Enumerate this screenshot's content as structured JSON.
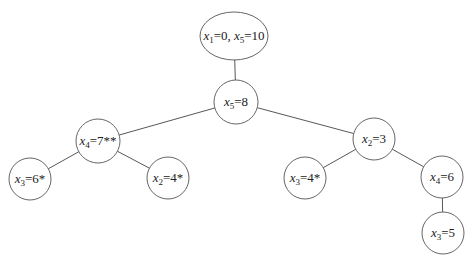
{
  "diagram": {
    "type": "branch-and-bound-tree",
    "width": 475,
    "height": 264,
    "colors": {
      "stroke": "#555555",
      "edge": "#444444",
      "text": "#222222",
      "background": "#ffffff"
    },
    "nodes": [
      {
        "id": "root",
        "shape": "ellipse",
        "cx": 234,
        "cy": 36,
        "rx": 34,
        "ry": 24,
        "terms": [
          {
            "var": "x",
            "sub": "1",
            "val": "=0, "
          },
          {
            "var": "x",
            "sub": "5",
            "val": "=10"
          }
        ]
      },
      {
        "id": "n_x5_8",
        "shape": "circle",
        "cx": 236,
        "cy": 102,
        "r": 22,
        "terms": [
          {
            "var": "x",
            "sub": "5",
            "val": "=8"
          }
        ]
      },
      {
        "id": "n_x4_7",
        "shape": "circle",
        "cx": 98,
        "cy": 141,
        "r": 22,
        "terms": [
          {
            "var": "x",
            "sub": "4",
            "val": "=7**"
          }
        ]
      },
      {
        "id": "n_x3_6",
        "shape": "circle",
        "cx": 30,
        "cy": 179,
        "r": 21,
        "terms": [
          {
            "var": "x",
            "sub": "3",
            "val": "=6*"
          }
        ]
      },
      {
        "id": "n_x2_4",
        "shape": "circle",
        "cx": 168,
        "cy": 178,
        "r": 21,
        "terms": [
          {
            "var": "x",
            "sub": "2",
            "val": "=4*"
          }
        ]
      },
      {
        "id": "n_x2_3",
        "shape": "circle",
        "cx": 374,
        "cy": 139,
        "r": 21,
        "terms": [
          {
            "var": "x",
            "sub": "2",
            "val": "=3"
          }
        ]
      },
      {
        "id": "n_x3_4",
        "shape": "circle",
        "cx": 305,
        "cy": 178,
        "r": 21,
        "terms": [
          {
            "var": "x",
            "sub": "3",
            "val": "=4*"
          }
        ]
      },
      {
        "id": "n_x4_6",
        "shape": "circle",
        "cx": 442,
        "cy": 177,
        "r": 21,
        "terms": [
          {
            "var": "x",
            "sub": "4",
            "val": "=6"
          }
        ]
      },
      {
        "id": "n_x3_5",
        "shape": "circle",
        "cx": 443,
        "cy": 233,
        "r": 21,
        "terms": [
          {
            "var": "x",
            "sub": "3",
            "val": "=5"
          }
        ]
      }
    ],
    "edges": [
      {
        "from": "root",
        "to": "n_x5_8"
      },
      {
        "from": "n_x5_8",
        "to": "n_x4_7"
      },
      {
        "from": "n_x5_8",
        "to": "n_x2_3"
      },
      {
        "from": "n_x4_7",
        "to": "n_x3_6"
      },
      {
        "from": "n_x4_7",
        "to": "n_x2_4"
      },
      {
        "from": "n_x2_3",
        "to": "n_x3_4"
      },
      {
        "from": "n_x2_3",
        "to": "n_x4_6"
      },
      {
        "from": "n_x4_6",
        "to": "n_x3_5"
      }
    ]
  }
}
